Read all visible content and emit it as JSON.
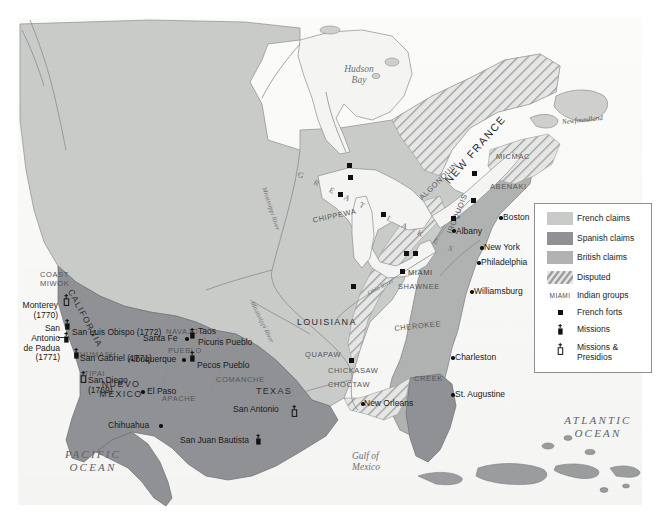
{
  "map": {
    "title": "North America: European Claims, Indian Groups, Forts and Missions",
    "colors": {
      "french_claims": "#c9cbc8",
      "spanish_claims": "#8f9194",
      "british_claims": "#b0b2b1",
      "disputed_hatch": "#9b9d9e",
      "water": "#f2f2f0",
      "land_base": "#d9dad7",
      "coastline": "#7b7d80",
      "marker": "#111111"
    },
    "legend": {
      "items": [
        {
          "key": "swatch-french",
          "label": "French claims"
        },
        {
          "key": "swatch-spanish",
          "label": "Spanish claims"
        },
        {
          "key": "swatch-british",
          "label": "British claims"
        },
        {
          "key": "swatch-disputed",
          "label": "Disputed"
        },
        {
          "key": "miami-sample",
          "label": "Indian groups",
          "sample": "MIAMI"
        },
        {
          "key": "fort-square",
          "label": "French forts"
        },
        {
          "key": "mission-symbol",
          "label": "Missions"
        },
        {
          "key": "presidio-symbol",
          "label": "Missions &\nPresidios"
        }
      ]
    },
    "oceans": [
      {
        "name": "pacific-ocean",
        "text": "PACIFIC\nOCEAN",
        "x": 38,
        "y": 448
      },
      {
        "name": "atlantic-ocean",
        "text": "ATLANTIC\nOCEAN",
        "x": 565,
        "y": 414
      }
    ],
    "water_bodies": [
      {
        "name": "hudson-bay",
        "text": "Hudson\nBay",
        "x": 335,
        "y": 64
      },
      {
        "name": "gulf-of-mexico",
        "text": "Gulf of\nMexico",
        "x": 355,
        "y": 453
      }
    ],
    "islands": [
      {
        "name": "newfoundland",
        "text": "Newfoundland",
        "x": 564,
        "y": 118
      }
    ],
    "lakes_label": {
      "name": "great-lakes",
      "text": "G R E A T   L A K E S",
      "x": 300,
      "y": 172
    },
    "rivers": [
      {
        "name": "mississippi-river-north",
        "text": "Mississippi River",
        "x": 265,
        "y": 185
      },
      {
        "name": "mississippi-river-south",
        "text": "Mississippi River",
        "x": 253,
        "y": 318
      },
      {
        "name": "ohio-river",
        "text": "Ohio River",
        "x": 368,
        "y": 293
      }
    ],
    "colonies": [
      {
        "name": "new-france",
        "text": "NEW FRANCE",
        "x": 455,
        "y": 150
      },
      {
        "name": "louisiana",
        "text": "LOUISIANA",
        "x": 300,
        "y": 319
      },
      {
        "name": "texas",
        "text": "TEXAS",
        "x": 258,
        "y": 388
      },
      {
        "name": "nuevo-mexico",
        "text": "NUEVO\nMEXICO",
        "x": 118,
        "y": 381
      },
      {
        "name": "california",
        "text": "CALIFORNIA",
        "x": 74,
        "y": 292
      }
    ],
    "tribes": [
      {
        "name": "coast-miwok",
        "text": "COAST\nMIWOK",
        "x": 40,
        "y": 273
      },
      {
        "name": "chumash",
        "text": "CHUMASH",
        "x": 78,
        "y": 353
      },
      {
        "name": "tipai",
        "text": "TIPAI",
        "x": 85,
        "y": 372
      },
      {
        "name": "navajo",
        "text": "NAVAJO",
        "x": 168,
        "y": 330
      },
      {
        "name": "pueblo",
        "text": "PUEBLO",
        "x": 170,
        "y": 349
      },
      {
        "name": "comanche",
        "text": "COMANCHE",
        "x": 218,
        "y": 378
      },
      {
        "name": "apache",
        "text": "APACHE",
        "x": 164,
        "y": 397
      },
      {
        "name": "chippewa",
        "text": "CHIPPEWA",
        "x": 315,
        "y": 219
      },
      {
        "name": "algonquin",
        "text": "ALGONQUIN",
        "x": 425,
        "y": 196
      },
      {
        "name": "iroquois",
        "text": "IROQUOIS",
        "x": 449,
        "y": 235
      },
      {
        "name": "micmac",
        "text": "MICMAC",
        "x": 498,
        "y": 155
      },
      {
        "name": "abenaki",
        "text": "ABENAKI",
        "x": 492,
        "y": 185
      },
      {
        "name": "miami",
        "text": "MIAMI",
        "x": 410,
        "y": 271
      },
      {
        "name": "shawnee",
        "text": "SHAWNEE",
        "x": 400,
        "y": 285
      },
      {
        "name": "cherokee",
        "text": "CHEROKEE",
        "x": 396,
        "y": 327
      },
      {
        "name": "quapaw",
        "text": "QUAPAW",
        "x": 307,
        "y": 353
      },
      {
        "name": "chickasaw",
        "text": "CHICKASAW",
        "x": 330,
        "y": 369
      },
      {
        "name": "choctaw",
        "text": "CHOCTAW",
        "x": 330,
        "y": 383
      },
      {
        "name": "creek",
        "text": "CREEK",
        "x": 416,
        "y": 377
      }
    ],
    "places_right": [
      {
        "name": "monterey",
        "text": "Monterey\n(1770)",
        "x": 15,
        "y": 303
      },
      {
        "name": "san-antonio-de-padua",
        "text": "San\nAntonio\nde Padua\n(1771)",
        "x": 8,
        "y": 326
      }
    ],
    "places": [
      {
        "name": "san-luis-obispo",
        "text": "San Luis Obispo (1772)",
        "x": 72,
        "y": 330
      },
      {
        "name": "san-gabriel",
        "text": "San Gabriel (1771)",
        "x": 80,
        "y": 357
      },
      {
        "name": "san-diego",
        "text": "San Diego\n(1769)",
        "x": 88,
        "y": 378
      },
      {
        "name": "santa-fe",
        "text": "Santa Fe",
        "x": 143,
        "y": 338
      },
      {
        "name": "albuquerque",
        "text": "Albuquerque",
        "x": 130,
        "y": 359
      },
      {
        "name": "taos",
        "text": "Taos",
        "x": 198,
        "y": 330
      },
      {
        "name": "picuris-pueblo",
        "text": "Picuris Pueblo",
        "x": 198,
        "y": 341
      },
      {
        "name": "pecos-pueblo",
        "text": "Pecos Pueblo",
        "x": 197,
        "y": 364
      },
      {
        "name": "el-paso",
        "text": "El Paso",
        "x": 148,
        "y": 391
      },
      {
        "name": "chihuahua",
        "text": "Chihuahua",
        "x": 110,
        "y": 425
      },
      {
        "name": "san-antonio",
        "text": "San Antonio",
        "x": 235,
        "y": 409
      },
      {
        "name": "san-juan-bautista",
        "text": "San Juan Bautista",
        "x": 182,
        "y": 439
      },
      {
        "name": "new-orleans",
        "text": "New Orleans",
        "x": 366,
        "y": 404
      },
      {
        "name": "st-augustine",
        "text": "St. Augustine",
        "x": 456,
        "y": 395
      },
      {
        "name": "charleston",
        "text": "Charleston",
        "x": 456,
        "y": 358
      },
      {
        "name": "williamsburg",
        "text": "Williamsburg",
        "x": 475,
        "y": 292
      },
      {
        "name": "philadelphia",
        "text": "Philadelphia",
        "x": 482,
        "y": 263
      },
      {
        "name": "new-york",
        "text": "New York",
        "x": 485,
        "y": 248
      },
      {
        "name": "albany",
        "text": "Albany",
        "x": 457,
        "y": 232
      },
      {
        "name": "boston",
        "text": "Boston",
        "x": 504,
        "y": 218
      }
    ],
    "forts": [
      {
        "name": "fort-lake-superior-n1",
        "x": 347,
        "y": 163
      },
      {
        "name": "fort-lake-superior-n2",
        "x": 348,
        "y": 175
      },
      {
        "name": "fort-lake-superior-w",
        "x": 340,
        "y": 192
      },
      {
        "name": "fort-lake-michigan",
        "x": 381,
        "y": 212
      },
      {
        "name": "fort-lake-erie",
        "x": 404,
        "y": 251
      },
      {
        "name": "fort-detroit",
        "x": 351,
        "y": 284
      },
      {
        "name": "fort-miami",
        "x": 400,
        "y": 270
      },
      {
        "name": "fort-ohio-valley",
        "x": 352,
        "y": 284
      },
      {
        "name": "fort-quebec",
        "x": 471,
        "y": 198
      },
      {
        "name": "fort-montreal",
        "x": 451,
        "y": 216
      },
      {
        "name": "fort-st-lawrence",
        "x": 472,
        "y": 171
      },
      {
        "name": "fort-mississippi",
        "x": 349,
        "y": 358
      }
    ],
    "dots": [
      {
        "name": "dot-albany",
        "x": 452,
        "y": 229
      },
      {
        "name": "dot-boston",
        "x": 499,
        "y": 216
      },
      {
        "name": "dot-new-york",
        "x": 480,
        "y": 246
      },
      {
        "name": "dot-philadelphia",
        "x": 477,
        "y": 261
      },
      {
        "name": "dot-williamsburg",
        "x": 470,
        "y": 290
      },
      {
        "name": "dot-charleston",
        "x": 451,
        "y": 356
      },
      {
        "name": "dot-st-augustine",
        "x": 451,
        "y": 393
      },
      {
        "name": "dot-new-orleans",
        "x": 361,
        "y": 402
      },
      {
        "name": "dot-santa-fe",
        "x": 185,
        "y": 337
      },
      {
        "name": "dot-albuquerque",
        "x": 182,
        "y": 358
      },
      {
        "name": "dot-el-paso",
        "x": 141,
        "y": 390
      },
      {
        "name": "dot-chihuahua",
        "x": 159,
        "y": 424
      }
    ],
    "missions": [
      {
        "name": "mission-san-luis-obispo",
        "x": 64,
        "y": 321
      },
      {
        "name": "mission-san-antonio-de-padua",
        "x": 63,
        "y": 333
      },
      {
        "name": "mission-san-gabriel",
        "x": 73,
        "y": 349
      },
      {
        "name": "mission-taos",
        "x": 189,
        "y": 329
      },
      {
        "name": "mission-pecos",
        "x": 189,
        "y": 352
      },
      {
        "name": "mission-san-juan-bautista",
        "x": 255,
        "y": 435
      }
    ],
    "presidios": [
      {
        "name": "presidio-monterey",
        "x": 63,
        "y": 295
      },
      {
        "name": "presidio-san-diego",
        "x": 80,
        "y": 372
      },
      {
        "name": "presidio-san-antonio",
        "x": 291,
        "y": 406
      }
    ]
  }
}
